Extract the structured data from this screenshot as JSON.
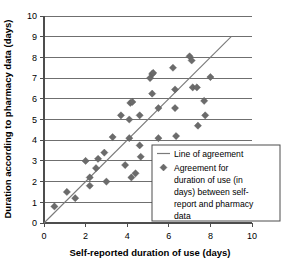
{
  "chart_data": {
    "type": "scatter",
    "title": "",
    "xlabel": "Self-reported duration of use (days)",
    "ylabel": "Duration according to pharmacy data (days)",
    "xlim": [
      0,
      10
    ],
    "ylim": [
      0,
      10
    ],
    "xticks": [
      0,
      2,
      4,
      6,
      8,
      10
    ],
    "yticks": [
      0,
      1,
      2,
      3,
      4,
      5,
      6,
      7,
      8,
      9,
      10
    ],
    "grid": "horizontal",
    "legend_position": "lower-right",
    "series": [
      {
        "name": "Line of agreement",
        "type": "line",
        "marker": "none",
        "color": "#7a7a7a",
        "x": [
          0,
          9
        ],
        "y": [
          0,
          9
        ]
      },
      {
        "name": "Agreement for duration of use (in days) between self-report and pharmacy data",
        "type": "scatter",
        "marker": "diamond",
        "color": "#6b6b6b",
        "points": [
          [
            0.5,
            0.8
          ],
          [
            1.1,
            1.5
          ],
          [
            1.5,
            1.2
          ],
          [
            2.0,
            3.0
          ],
          [
            2.2,
            2.2
          ],
          [
            2.2,
            1.8
          ],
          [
            2.5,
            2.65
          ],
          [
            2.6,
            3.1
          ],
          [
            2.9,
            3.4
          ],
          [
            3.0,
            2.0
          ],
          [
            3.3,
            4.15
          ],
          [
            3.7,
            5.2
          ],
          [
            3.9,
            2.8
          ],
          [
            4.1,
            5.0
          ],
          [
            4.15,
            5.8
          ],
          [
            4.25,
            5.85
          ],
          [
            4.1,
            4.1
          ],
          [
            4.2,
            2.2
          ],
          [
            4.4,
            2.4
          ],
          [
            4.6,
            5.2
          ],
          [
            4.6,
            3.75
          ],
          [
            4.65,
            3.2
          ],
          [
            5.1,
            7.0
          ],
          [
            5.2,
            7.2
          ],
          [
            5.25,
            7.25
          ],
          [
            5.2,
            6.25
          ],
          [
            5.5,
            5.55
          ],
          [
            5.5,
            4.1
          ],
          [
            6.2,
            7.5
          ],
          [
            6.3,
            6.45
          ],
          [
            6.3,
            5.55
          ],
          [
            6.35,
            4.2
          ],
          [
            7.0,
            8.05
          ],
          [
            7.1,
            7.85
          ],
          [
            7.15,
            6.55
          ],
          [
            7.35,
            6.55
          ],
          [
            7.4,
            4.7
          ],
          [
            7.7,
            5.9
          ],
          [
            7.75,
            5.2
          ],
          [
            8.0,
            7.05
          ]
        ]
      }
    ],
    "legend": [
      {
        "label": "Line of agreement",
        "symbol": "line",
        "color": "#7a7a7a"
      },
      {
        "label": "Agreement for duration of use (in days) between self-report and pharmacy data",
        "symbol": "diamond",
        "color": "#6b6b6b"
      }
    ],
    "legend_lines": [
      "Line of agreement",
      "Agreement for",
      "duration of use (in",
      "days) between self-",
      "report and pharmacy",
      "data"
    ]
  }
}
